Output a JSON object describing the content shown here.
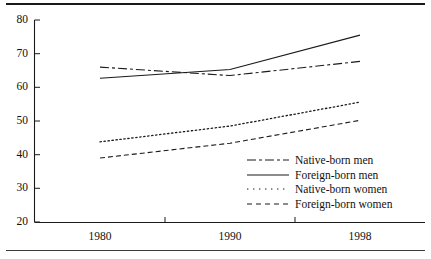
{
  "chart_data": {
    "type": "line",
    "title": "",
    "subtitle": "",
    "xlabel": "",
    "ylabel": "",
    "x": [
      1980,
      1990,
      1998
    ],
    "categories": [
      "1980",
      "1990",
      "1998"
    ],
    "xtick_labels": [
      "1980",
      "1990",
      "1998"
    ],
    "ytick_labels": [
      "20",
      "30",
      "40",
      "50",
      "60",
      "70",
      "80"
    ],
    "yticks": [
      20,
      30,
      40,
      50,
      60,
      70,
      80
    ],
    "ylim": [
      20,
      80
    ],
    "xlim": [
      1977.5,
      2000.5
    ],
    "grid": false,
    "legend_position": "inside-lower-right",
    "line_color": "#1a1a1a",
    "series": [
      {
        "name": "Native-born men",
        "values": [
          66.0,
          63.5,
          67.7
        ],
        "style": "dash-dot-long",
        "dasharray": "9,3,3,3"
      },
      {
        "name": "Foreign-born men",
        "values": [
          62.7,
          65.3,
          75.5
        ],
        "style": "solid",
        "dasharray": "none"
      },
      {
        "name": "Native-born women",
        "values": [
          43.8,
          48.5,
          55.6
        ],
        "style": "dotted",
        "dasharray": "1.4,2.6"
      },
      {
        "name": "Foreign-born women",
        "values": [
          39.0,
          43.4,
          50.2
        ],
        "style": "dashed",
        "dasharray": "5,3"
      }
    ]
  },
  "legend": {
    "items": [
      {
        "label": "Native-born men"
      },
      {
        "label": "Foreign-born men"
      },
      {
        "label": "Native-born women"
      },
      {
        "label": "Foreign-born women"
      }
    ]
  },
  "axes": {
    "y_labels": [
      "80",
      "70",
      "60",
      "50",
      "40",
      "30",
      "20"
    ],
    "x_labels": [
      "1980",
      "1990",
      "1998"
    ]
  }
}
